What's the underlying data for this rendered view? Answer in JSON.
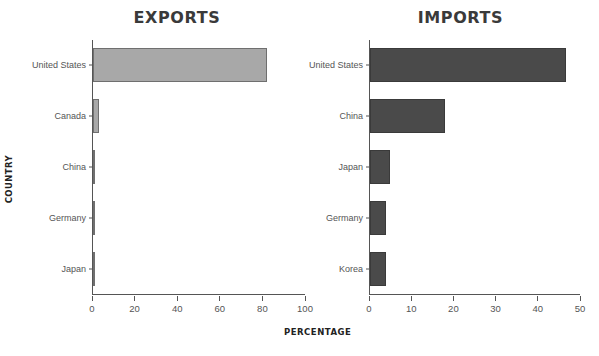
{
  "chart_data": [
    {
      "type": "bar",
      "orientation": "horizontal",
      "title": "EXPORTS",
      "xlabel": "PERCENTAGE",
      "ylabel": "COUNTRY",
      "categories": [
        "United States",
        "Canada",
        "China",
        "Germany",
        "Japan"
      ],
      "values": [
        82,
        3,
        0.7,
        0.7,
        0.7
      ],
      "xlim": [
        0,
        100
      ],
      "xticks": [
        0,
        20,
        40,
        60,
        80,
        100
      ],
      "xtick_labels": [
        "0",
        "20",
        "40",
        "60",
        "80",
        "100"
      ],
      "grid": false,
      "legend": false,
      "bar_color": "#a8a8a8",
      "bar_edge_color": "#6f6f6f"
    },
    {
      "type": "bar",
      "orientation": "horizontal",
      "title": "IMPORTS",
      "xlabel": "PERCENTAGE",
      "ylabel": "",
      "categories": [
        "United States",
        "China",
        "Japan",
        "Germany",
        "Korea"
      ],
      "values": [
        46.7,
        17.8,
        4.7,
        3.8,
        3.8
      ],
      "xlim": [
        0,
        50
      ],
      "xticks": [
        0,
        10,
        20,
        30,
        40,
        50
      ],
      "xtick_labels": [
        "0",
        "10",
        "20",
        "30",
        "40",
        "50"
      ],
      "grid": false,
      "legend": false,
      "bar_color": "#4a4a4a",
      "bar_edge_color": "#3a3a3a"
    }
  ],
  "figure": {
    "background": "#ffffff",
    "axis_color": "#555555"
  }
}
